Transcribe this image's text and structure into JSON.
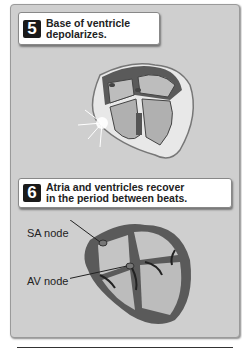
{
  "steps": [
    {
      "number": "5",
      "text_line1": "Base of ventricle",
      "text_line2": "depolarizes."
    },
    {
      "number": "6",
      "text_line1": "Atria and ventricles recover",
      "text_line2": "in the period  between beats."
    }
  ],
  "labels": {
    "sa_node": "SA node",
    "av_node": "AV node"
  },
  "colors": {
    "panel_bg": "#cfcfcf",
    "heart_wall": "#5a5a5a",
    "chamber": "#b8b8b8",
    "callout_number_bg": "#1a1a1a"
  }
}
